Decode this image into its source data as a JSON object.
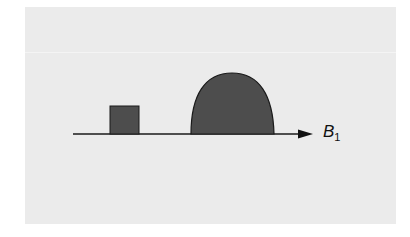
{
  "figure": {
    "axis": {
      "label": "B",
      "subscript": "1",
      "x_start": 73,
      "x_end": 313,
      "y": 134
    },
    "pulses": [
      {
        "name": "rectangular-pulse",
        "shape": "rectangle",
        "x_start": 110,
        "x_end": 139,
        "height": 28
      },
      {
        "name": "dome-pulse",
        "shape": "dome",
        "x_start": 191,
        "x_end": 274,
        "height": 61
      }
    ],
    "colors": {
      "fill": "#4d4d4d",
      "stroke": "#1a1a1a",
      "background": "#ebebeb"
    }
  }
}
